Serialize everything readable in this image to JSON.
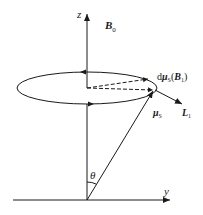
{
  "diagram": {
    "axes": {
      "z_label": "z",
      "y_label": "y",
      "angle_label": "θ"
    },
    "vectors": {
      "field": {
        "main": "B",
        "sub": "0"
      },
      "moment": {
        "main": "μ",
        "sub": "S"
      },
      "torque_axis": {
        "main": "L",
        "sub": "1"
      },
      "change": {
        "prefix": "d",
        "main": "μ",
        "sub": "S",
        "arg_main": "B",
        "arg_sub": "1"
      }
    },
    "colors": {
      "line": "#1a1a1a"
    }
  }
}
